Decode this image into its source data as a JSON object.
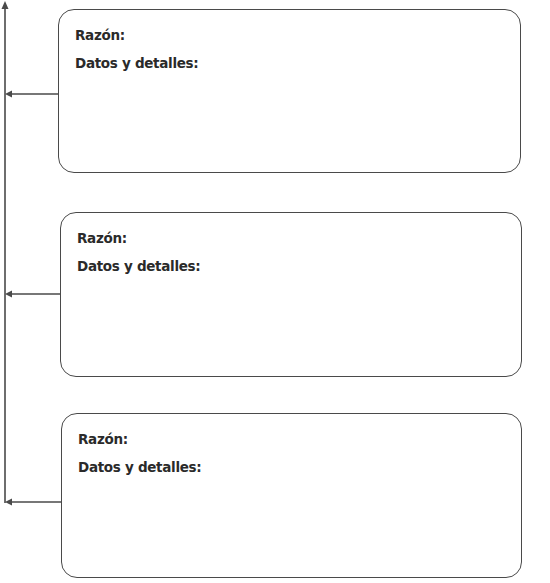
{
  "organizer": {
    "boxes": [
      {
        "reason_label": "Razón:",
        "details_label": "Datos y detalles:"
      },
      {
        "reason_label": "Razón:",
        "details_label": "Datos y detalles:"
      },
      {
        "reason_label": "Razón:",
        "details_label": "Datos y detalles:"
      }
    ],
    "line_color": "#4a4a4a"
  }
}
